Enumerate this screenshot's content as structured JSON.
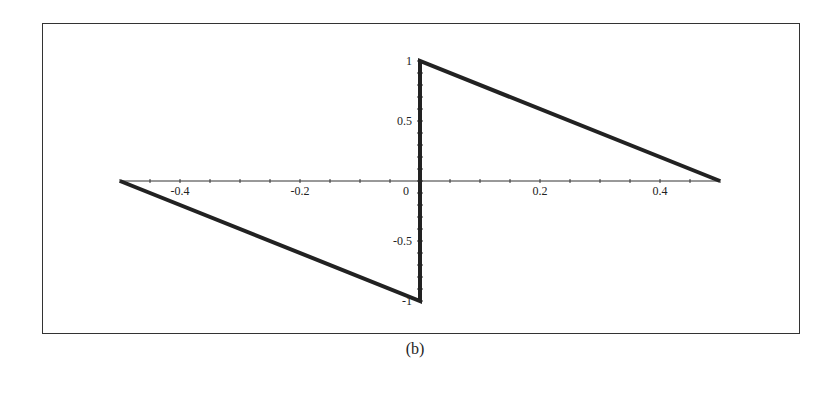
{
  "chart_data": {
    "type": "line",
    "title": "",
    "caption": "(b)",
    "xlabel": "",
    "ylabel": "",
    "xlim": [
      -0.5,
      0.5
    ],
    "ylim": [
      -1,
      1
    ],
    "grid": false,
    "legend": null,
    "x_ticks": [
      -0.4,
      -0.2,
      0,
      0.2,
      0.4
    ],
    "x_tick_labels": [
      "-0.4",
      "-0.2",
      "0",
      "0.2",
      "0.4"
    ],
    "y_ticks": [
      -1,
      -0.5,
      0.5,
      1
    ],
    "y_tick_labels": [
      "-1",
      "-0.5",
      "0.5",
      "1"
    ],
    "series": [
      {
        "name": "sawtooth",
        "x": [
          -0.5,
          0,
          0,
          0.5
        ],
        "y": [
          0,
          -1,
          1,
          0
        ]
      }
    ],
    "colors": {
      "line": "#222222",
      "axis": "#333333",
      "frame": "#333333"
    }
  }
}
